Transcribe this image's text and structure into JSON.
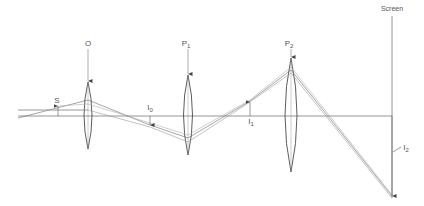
{
  "diagram": {
    "colors": {
      "line": "#6a6a6a",
      "lens": "#4a4a4a",
      "ray": "#8a8a8a",
      "text": "#555555",
      "background": "#ffffff"
    },
    "labels": {
      "screen": "Screen",
      "objective": "O",
      "p1_main": "P",
      "p1_sub": "1",
      "p2_main": "P",
      "p2_sub": "2",
      "object": "S",
      "i0_main": "I",
      "i0_sub": "0",
      "i1_main": "I",
      "i1_sub": "1",
      "i2_main": "I",
      "i2_sub": "2"
    },
    "elements": {
      "optical_axis": {
        "x1": 18,
        "x2": 392,
        "y": 116
      },
      "lenses": [
        {
          "id": "O",
          "x": 88,
          "top": 82,
          "bottom": 149,
          "half_width": 7
        },
        {
          "id": "P1",
          "x": 188,
          "top": 75,
          "bottom": 155,
          "half_width": 7
        },
        {
          "id": "P2",
          "x": 291,
          "top": 58,
          "bottom": 172,
          "half_width": 11
        }
      ],
      "screen": {
        "x": 392,
        "top": 16,
        "bottom": 198
      },
      "images": [
        {
          "id": "S",
          "x": 58,
          "tip_y": 106
        },
        {
          "id": "I0",
          "x": 150,
          "tip_y": 125
        },
        {
          "id": "I1",
          "x": 250,
          "tip_y": 101
        },
        {
          "id": "I2",
          "x": 392,
          "tip_y": 196
        }
      ]
    }
  }
}
